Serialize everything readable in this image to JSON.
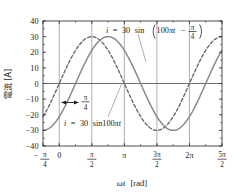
{
  "chart_data": {
    "type": "line",
    "title": "",
    "xlabel": "ωt [rad]",
    "ylabel": "電流 [A]",
    "xlim": [
      -0.7853981634,
      7.853981634
    ],
    "ylim": [
      -40,
      40
    ],
    "grid": true,
    "legend": "inline-annotations",
    "xticks": [
      {
        "value": -0.7853981634,
        "label": "-π/4",
        "numerator": "π",
        "denominator": "4",
        "sign": "−"
      },
      {
        "value": 0,
        "label": "0"
      },
      {
        "value": 1.5707963268,
        "label": "π/2",
        "numerator": "π",
        "denominator": "2"
      },
      {
        "value": 3.1415926536,
        "label": "π"
      },
      {
        "value": 4.7123889804,
        "label": "3π/2",
        "numerator": "3π",
        "denominator": "2"
      },
      {
        "value": 6.2831853072,
        "label": "2π"
      },
      {
        "value": 7.853981634,
        "label": "5π/2",
        "numerator": "5π",
        "denominator": "2"
      }
    ],
    "yticks": [
      {
        "value": 40,
        "label": "40"
      },
      {
        "value": 30,
        "label": "30"
      },
      {
        "value": 20,
        "label": "20"
      },
      {
        "value": 10,
        "label": "10"
      },
      {
        "value": 0,
        "label": "0"
      },
      {
        "value": -10,
        "label": "−10"
      },
      {
        "value": -20,
        "label": "−20"
      },
      {
        "value": -30,
        "label": "−30"
      },
      {
        "value": -40,
        "label": "−40"
      }
    ],
    "series": [
      {
        "name": "i = 30 sin 100πt",
        "style": "dashed",
        "color": "#6b6b6b",
        "amplitude": 30,
        "phase_rad": 0,
        "equation_plain": "i = 30 sin100πt",
        "equation_parts": {
          "lhs": "i",
          "eq": "=",
          "amplitude": "30",
          "fn": "sin",
          "arg": "100πt"
        }
      },
      {
        "name": "i = 30 sin(100πt − π/4)",
        "style": "solid",
        "color": "#8a8a8a",
        "amplitude": 30,
        "phase_rad": -0.7853981634,
        "equation_plain": "i = 30 sin(100πt − π/4)",
        "equation_parts": {
          "lhs": "i",
          "eq": "=",
          "amplitude": "30",
          "fn": "sin",
          "arg_open": "(",
          "arg": "100πt",
          "minus": "−",
          "phase_num": "π",
          "phase_den": "4",
          "arg_close": ")"
        }
      }
    ],
    "annotations": [
      {
        "name": "phase-shift-arrow",
        "label_num": "π",
        "label_den": "4",
        "from_x": 0,
        "to_x": 0.7853981634,
        "y": -12
      },
      {
        "name": "upper-equation-label",
        "text": "i = 30 sin(100πt − π/4)"
      },
      {
        "name": "lower-equation-label",
        "text": "i = 30 sin100πt"
      }
    ]
  },
  "axis": {
    "y_label_text": "電流 [A]",
    "x_label_omega": "ωt",
    "x_label_unit": "[rad]"
  },
  "colors": {
    "background": "#ffffff",
    "frame": "#3a3a3a",
    "grid": "#8c8c8c",
    "solid_curve": "#8a8a8a",
    "dashed_curve": "#6b6b6b",
    "text": "#1a1a1a"
  }
}
